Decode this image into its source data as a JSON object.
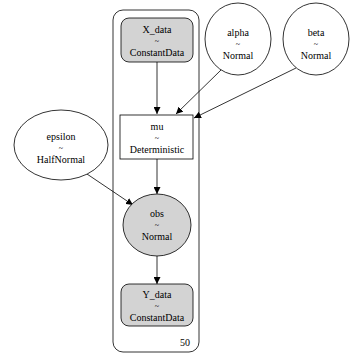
{
  "graph": {
    "plate": {
      "label": "50"
    },
    "nodes": {
      "X_data": {
        "name": "X_data",
        "sep": "~",
        "dist": "ConstantData",
        "shape": "box-rounded",
        "fill": "#d3d3d3"
      },
      "alpha": {
        "name": "alpha",
        "sep": "~",
        "dist": "Normal",
        "shape": "ellipse",
        "fill": "#ffffff"
      },
      "beta": {
        "name": "beta",
        "sep": "~",
        "dist": "Normal",
        "shape": "ellipse",
        "fill": "#ffffff"
      },
      "mu": {
        "name": "mu",
        "sep": "~",
        "dist": "Deterministic",
        "shape": "box",
        "fill": "#ffffff"
      },
      "epsilon": {
        "name": "epsilon",
        "sep": "~",
        "dist": "HalfNormal",
        "shape": "ellipse",
        "fill": "#ffffff"
      },
      "obs": {
        "name": "obs",
        "sep": "~",
        "dist": "Normal",
        "shape": "ellipse",
        "fill": "#d3d3d3"
      },
      "Y_data": {
        "name": "Y_data",
        "sep": "~",
        "dist": "ConstantData",
        "shape": "box-rounded",
        "fill": "#d3d3d3"
      }
    },
    "edges": [
      {
        "from": "X_data",
        "to": "mu"
      },
      {
        "from": "alpha",
        "to": "mu"
      },
      {
        "from": "beta",
        "to": "mu"
      },
      {
        "from": "mu",
        "to": "obs"
      },
      {
        "from": "epsilon",
        "to": "obs"
      },
      {
        "from": "obs",
        "to": "Y_data"
      }
    ]
  }
}
